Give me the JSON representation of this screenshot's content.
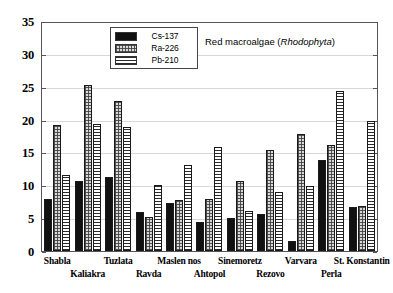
{
  "chart_data": {
    "type": "bar",
    "title": "",
    "annotation": "Red macroalgae ( Rhodophyta )",
    "annotation_plain": "Red macroalgae (",
    "annotation_italic": "Rhodophyta",
    "annotation_tail": ")",
    "xlabel": "",
    "ylabel": "",
    "ylim": [
      0,
      35
    ],
    "yticks": [
      0,
      5,
      10,
      15,
      20,
      25,
      30,
      35
    ],
    "ytick_labels": [
      "0",
      "5",
      "10",
      "15",
      "20",
      "25",
      "30",
      "35"
    ],
    "grid": true,
    "legend_position": "top-center",
    "categories": [
      "Shabla",
      "Kaliakra",
      "Tuzlata",
      "Ravda",
      "Maslen nos",
      "Ahtopol",
      "Sinemoretz",
      "Rezovo",
      "Varvara",
      "Perla",
      "St. Konstantin"
    ],
    "series": [
      {
        "name": "Cs-137",
        "color": "#111111",
        "pattern": "solid",
        "values": [
          8.0,
          10.8,
          11.3,
          6.0,
          7.3,
          4.5,
          5.0,
          5.7,
          1.5,
          14.0,
          6.8
        ]
      },
      {
        "name": "Ra-226",
        "color": "#d9d9d9",
        "pattern": "dotted",
        "values": [
          19.3,
          25.5,
          23.0,
          5.2,
          7.8,
          8.0,
          10.8,
          15.5,
          18.0,
          16.2,
          6.9
        ]
      },
      {
        "name": "Pb-210",
        "color": "#ffffff",
        "pattern": "horizontal-lines",
        "values": [
          11.7,
          19.5,
          19.0,
          10.2,
          13.2,
          16.0,
          6.2,
          9.0,
          10.0,
          24.5,
          20.0
        ]
      }
    ]
  },
  "legend": {
    "items": [
      {
        "label": "Cs-137",
        "swatch": "cs"
      },
      {
        "label": "Ra-226",
        "swatch": "ra"
      },
      {
        "label": "Pb-210",
        "swatch": "pb"
      }
    ]
  }
}
